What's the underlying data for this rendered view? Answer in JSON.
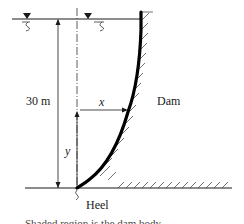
{
  "diagram": {
    "type": "dam-cross-section",
    "labels": {
      "height": "30 m",
      "x_var": "x",
      "y_var": "y",
      "dam": "Dam",
      "heel": "Heel",
      "caption_partial": "Shaded region is the dam body"
    },
    "colors": {
      "line": "#1a1a1a",
      "dam_face": "#000000",
      "text": "#222222"
    },
    "markers": {
      "free_surface_count": 2
    }
  }
}
